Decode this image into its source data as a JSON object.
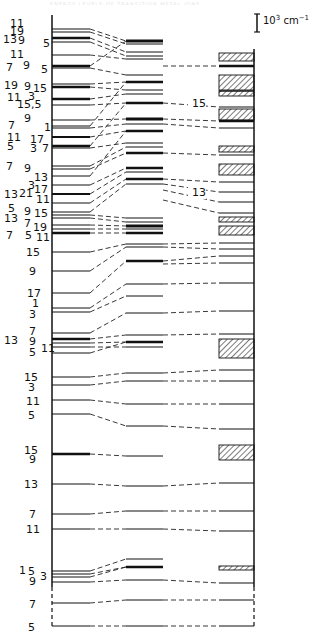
{
  "figure": {
    "header_ghost_text": "ENERGY LEVELS OF TRANSITION METAL IONS",
    "scale_bar": {
      "label": "10",
      "exponent": "3",
      "unit": " cm",
      "unit_exponent": "−1",
      "x": 257,
      "y1": 14,
      "y2": 32
    },
    "connector_labels": [
      {
        "text": "15",
        "x": 192,
        "y": 107
      },
      {
        "text": "13",
        "x": 192,
        "y": 196
      }
    ],
    "columns": {
      "left": {
        "x1": 52,
        "x2": 90
      },
      "middle": {
        "x1": 126,
        "x2": 163
      },
      "right": {
        "x1": 219,
        "x2": 254
      }
    },
    "axis": {
      "x": 52,
      "y_top": 15,
      "y_solid_end": 587,
      "y_bottom": 627,
      "right_x": 254,
      "right_y_top": 49,
      "right_y_solid_end": 587
    },
    "left_levels": [
      {
        "y": 29,
        "w": 1
      },
      {
        "y": 32,
        "w": 1
      },
      {
        "y": 38,
        "w": 2.5
      },
      {
        "y": 42,
        "w": 1
      },
      {
        "y": 55,
        "w": 1
      },
      {
        "y": 66,
        "w": 2.5
      },
      {
        "y": 68,
        "w": 1
      },
      {
        "y": 84,
        "w": 1
      },
      {
        "y": 87,
        "w": 2.5
      },
      {
        "y": 99,
        "w": 2.5
      },
      {
        "y": 105,
        "w": 1
      },
      {
        "y": 120,
        "w": 1
      },
      {
        "y": 126,
        "w": 1
      },
      {
        "y": 128,
        "w": 1
      },
      {
        "y": 137,
        "w": 2
      },
      {
        "y": 146,
        "w": 2.5
      },
      {
        "y": 148,
        "w": 1
      },
      {
        "y": 166,
        "w": 1
      },
      {
        "y": 169,
        "w": 1
      },
      {
        "y": 176,
        "w": 1
      },
      {
        "y": 185,
        "w": 1
      },
      {
        "y": 194,
        "w": 2
      },
      {
        "y": 203,
        "w": 1
      },
      {
        "y": 212,
        "w": 1
      },
      {
        "y": 215,
        "w": 1
      },
      {
        "y": 218,
        "w": 1
      },
      {
        "y": 225,
        "w": 1
      },
      {
        "y": 229,
        "w": 1
      },
      {
        "y": 233,
        "w": 2.5
      },
      {
        "y": 252,
        "w": 1
      },
      {
        "y": 271,
        "w": 1
      },
      {
        "y": 293,
        "w": 1
      },
      {
        "y": 308,
        "w": 1
      },
      {
        "y": 312,
        "w": 1
      },
      {
        "y": 333,
        "w": 1
      },
      {
        "y": 339,
        "w": 2.5
      },
      {
        "y": 343,
        "w": 1
      },
      {
        "y": 347,
        "w": 1
      },
      {
        "y": 353,
        "w": 1
      },
      {
        "y": 377,
        "w": 1
      },
      {
        "y": 385,
        "w": 1
      },
      {
        "y": 400,
        "w": 1
      },
      {
        "y": 414,
        "w": 1
      },
      {
        "y": 454,
        "w": 2.5
      },
      {
        "y": 484,
        "w": 1
      },
      {
        "y": 514,
        "w": 1
      },
      {
        "y": 529,
        "w": 1
      },
      {
        "y": 571,
        "w": 1
      },
      {
        "y": 574,
        "w": 1
      },
      {
        "y": 577,
        "w": 1
      },
      {
        "y": 582,
        "w": 1
      },
      {
        "y": 603,
        "w": 1
      },
      {
        "y": 626,
        "w": 1
      }
    ],
    "middle_levels": [
      {
        "y": 41,
        "w": 3
      },
      {
        "y": 44,
        "w": 1
      },
      {
        "y": 52,
        "w": 1
      },
      {
        "y": 56,
        "w": 1
      },
      {
        "y": 59,
        "w": 1
      },
      {
        "y": 75,
        "w": 1
      },
      {
        "y": 82,
        "w": 2.5
      },
      {
        "y": 90,
        "w": 1
      },
      {
        "y": 94,
        "w": 1
      },
      {
        "y": 103,
        "w": 2.5
      },
      {
        "y": 119,
        "w": 3
      },
      {
        "y": 124,
        "w": 1
      },
      {
        "y": 131,
        "w": 2.5
      },
      {
        "y": 143,
        "w": 1
      },
      {
        "y": 147,
        "w": 1
      },
      {
        "y": 153,
        "w": 2.5
      },
      {
        "y": 168,
        "w": 2.5
      },
      {
        "y": 172,
        "w": 1
      },
      {
        "y": 179,
        "w": 2.5
      },
      {
        "y": 184,
        "w": 1
      },
      {
        "y": 218,
        "w": 1
      },
      {
        "y": 222,
        "w": 1
      },
      {
        "y": 226,
        "w": 3
      },
      {
        "y": 229,
        "w": 1
      },
      {
        "y": 233,
        "w": 2.5
      },
      {
        "y": 244,
        "w": 1
      },
      {
        "y": 247,
        "w": 1
      },
      {
        "y": 261,
        "w": 2.5
      },
      {
        "y": 284,
        "w": 1
      },
      {
        "y": 296,
        "w": 1
      },
      {
        "y": 313,
        "w": 1
      },
      {
        "y": 335,
        "w": 1
      },
      {
        "y": 342,
        "w": 2.5
      },
      {
        "y": 347,
        "w": 1
      },
      {
        "y": 373,
        "w": 1
      },
      {
        "y": 381,
        "w": 1
      },
      {
        "y": 404,
        "w": 1
      },
      {
        "y": 426,
        "w": 1
      },
      {
        "y": 456,
        "w": 1
      },
      {
        "y": 486,
        "w": 1
      },
      {
        "y": 511,
        "w": 1
      },
      {
        "y": 529,
        "w": 1
      },
      {
        "y": 559,
        "w": 1
      },
      {
        "y": 567,
        "w": 2.5
      },
      {
        "y": 580,
        "w": 1
      },
      {
        "y": 600,
        "w": 1
      },
      {
        "y": 626,
        "w": 1
      }
    ],
    "right_levels": [
      {
        "y": 66,
        "w": 2.5
      },
      {
        "y": 91,
        "w": 1
      },
      {
        "y": 107,
        "w": 1
      },
      {
        "y": 121,
        "w": 2.5
      },
      {
        "y": 128,
        "w": 1
      },
      {
        "y": 155,
        "w": 1
      },
      {
        "y": 182,
        "w": 1
      },
      {
        "y": 192,
        "w": 1
      },
      {
        "y": 202,
        "w": 1
      },
      {
        "y": 213,
        "w": 1
      },
      {
        "y": 243,
        "w": 1
      },
      {
        "y": 249,
        "w": 1
      },
      {
        "y": 256,
        "w": 1
      },
      {
        "y": 263,
        "w": 1
      },
      {
        "y": 283,
        "w": 1
      },
      {
        "y": 311,
        "w": 1
      },
      {
        "y": 334,
        "w": 1
      },
      {
        "y": 370,
        "w": 1
      },
      {
        "y": 381,
        "w": 1
      },
      {
        "y": 404,
        "w": 1
      },
      {
        "y": 429,
        "w": 1
      },
      {
        "y": 483,
        "w": 1
      },
      {
        "y": 511,
        "w": 1
      },
      {
        "y": 531,
        "w": 1
      },
      {
        "y": 583,
        "w": 1
      },
      {
        "y": 600,
        "w": 1
      },
      {
        "y": 626,
        "w": 1
      }
    ],
    "hatched_bands": [
      {
        "y": 53,
        "h": 8
      },
      {
        "y": 75,
        "h": 15
      },
      {
        "y": 91,
        "h": 5
      },
      {
        "y": 109,
        "h": 11
      },
      {
        "y": 146,
        "h": 6
      },
      {
        "y": 164,
        "h": 11
      },
      {
        "y": 217,
        "h": 5
      },
      {
        "y": 226,
        "h": 9
      },
      {
        "y": 339,
        "h": 19
      },
      {
        "y": 445,
        "h": 15
      },
      {
        "y": 566,
        "h": 4
      }
    ],
    "connectors": [
      [
        90,
        29,
        126,
        41
      ],
      [
        90,
        32,
        126,
        44
      ],
      [
        90,
        38,
        126,
        52
      ],
      [
        90,
        42,
        126,
        56
      ],
      [
        90,
        55,
        126,
        59
      ],
      [
        90,
        66,
        126,
        41
      ],
      [
        90,
        68,
        126,
        75
      ],
      [
        90,
        84,
        126,
        82
      ],
      [
        90,
        87,
        126,
        90
      ],
      [
        90,
        99,
        126,
        94
      ],
      [
        90,
        105,
        126,
        103
      ],
      [
        90,
        120,
        126,
        119
      ],
      [
        90,
        126,
        126,
        82
      ],
      [
        90,
        128,
        126,
        124
      ],
      [
        90,
        137,
        126,
        131
      ],
      [
        90,
        146,
        126,
        103
      ],
      [
        90,
        148,
        126,
        143
      ],
      [
        90,
        166,
        126,
        147
      ],
      [
        90,
        169,
        126,
        153
      ],
      [
        90,
        176,
        126,
        131
      ],
      [
        90,
        185,
        126,
        168
      ],
      [
        90,
        194,
        126,
        172
      ],
      [
        90,
        203,
        126,
        179
      ],
      [
        90,
        212,
        126,
        184
      ],
      [
        90,
        215,
        126,
        218
      ],
      [
        90,
        218,
        126,
        222
      ],
      [
        90,
        225,
        126,
        226
      ],
      [
        90,
        229,
        126,
        229
      ],
      [
        90,
        233,
        126,
        233
      ],
      [
        90,
        252,
        126,
        244
      ],
      [
        90,
        271,
        126,
        247
      ],
      [
        90,
        293,
        126,
        261
      ],
      [
        90,
        308,
        126,
        284
      ],
      [
        90,
        312,
        126,
        296
      ],
      [
        90,
        333,
        126,
        313
      ],
      [
        90,
        339,
        126,
        335
      ],
      [
        90,
        343,
        126,
        342
      ],
      [
        90,
        347,
        126,
        347
      ],
      [
        90,
        353,
        126,
        342
      ],
      [
        90,
        377,
        126,
        373
      ],
      [
        90,
        385,
        126,
        381
      ],
      [
        90,
        400,
        126,
        404
      ],
      [
        90,
        414,
        126,
        426
      ],
      [
        90,
        454,
        126,
        456
      ],
      [
        90,
        484,
        126,
        486
      ],
      [
        90,
        514,
        126,
        511
      ],
      [
        90,
        529,
        126,
        529
      ],
      [
        90,
        571,
        126,
        559
      ],
      [
        90,
        574,
        126,
        567
      ],
      [
        90,
        577,
        126,
        567
      ],
      [
        90,
        582,
        126,
        580
      ],
      [
        90,
        603,
        126,
        600
      ],
      [
        90,
        626,
        126,
        626
      ],
      [
        163,
        66,
        219,
        66
      ],
      [
        163,
        103,
        219,
        107
      ],
      [
        163,
        119,
        219,
        121
      ],
      [
        163,
        124,
        219,
        128
      ],
      [
        163,
        153,
        219,
        155
      ],
      [
        163,
        179,
        219,
        182
      ],
      [
        163,
        184,
        219,
        192
      ],
      [
        163,
        190,
        219,
        202
      ],
      [
        163,
        200,
        219,
        213
      ],
      [
        163,
        244,
        219,
        243
      ],
      [
        163,
        247,
        219,
        249
      ],
      [
        163,
        261,
        219,
        256
      ],
      [
        163,
        264,
        219,
        263
      ],
      [
        163,
        284,
        219,
        283
      ],
      [
        163,
        313,
        219,
        311
      ],
      [
        163,
        335,
        219,
        334
      ],
      [
        163,
        373,
        219,
        370
      ],
      [
        163,
        381,
        219,
        381
      ],
      [
        163,
        404,
        219,
        404
      ],
      [
        163,
        426,
        219,
        429
      ],
      [
        163,
        486,
        219,
        483
      ],
      [
        163,
        511,
        219,
        511
      ],
      [
        163,
        529,
        219,
        531
      ],
      [
        163,
        580,
        219,
        583
      ],
      [
        163,
        600,
        219,
        600
      ],
      [
        163,
        626,
        219,
        626
      ]
    ],
    "left_labels": [
      {
        "text": "11",
        "x": 10,
        "y": 27
      },
      {
        "text": "19",
        "x": 10,
        "y": 35
      },
      {
        "text": "13",
        "x": 3,
        "y": 43
      },
      {
        "text": "9",
        "x": 18,
        "y": 44
      },
      {
        "text": "5",
        "x": 43,
        "y": 47
      },
      {
        "text": "11",
        "x": 10,
        "y": 58
      },
      {
        "text": "7",
        "x": 6,
        "y": 71
      },
      {
        "text": "9",
        "x": 23,
        "y": 69
      },
      {
        "text": "5",
        "x": 41,
        "y": 73
      },
      {
        "text": "19",
        "x": 4,
        "y": 89
      },
      {
        "text": "9",
        "x": 24,
        "y": 90
      },
      {
        "text": "15",
        "x": 33,
        "y": 92
      },
      {
        "text": "11",
        "x": 7,
        "y": 101
      },
      {
        "text": "3",
        "x": 28,
        "y": 100
      },
      {
        "text": "15,5",
        "x": 17,
        "y": 108
      },
      {
        "text": "9",
        "x": 24,
        "y": 122
      },
      {
        "text": "7",
        "x": 8,
        "y": 129
      },
      {
        "text": "1",
        "x": 44,
        "y": 131
      },
      {
        "text": "11",
        "x": 7,
        "y": 141
      },
      {
        "text": "17",
        "x": 30,
        "y": 143
      },
      {
        "text": "5",
        "x": 7,
        "y": 150
      },
      {
        "text": "3",
        "x": 30,
        "y": 152
      },
      {
        "text": "7",
        "x": 42,
        "y": 152
      },
      {
        "text": "7",
        "x": 6,
        "y": 170
      },
      {
        "text": "9",
        "x": 24,
        "y": 172
      },
      {
        "text": "13",
        "x": 34,
        "y": 181
      },
      {
        "text": "3",
        "x": 28,
        "y": 189
      },
      {
        "text": "17",
        "x": 34,
        "y": 193
      },
      {
        "text": "13",
        "x": 4,
        "y": 198
      },
      {
        "text": "21",
        "x": 19,
        "y": 197
      },
      {
        "text": "11",
        "x": 36,
        "y": 203
      },
      {
        "text": "5",
        "x": 8,
        "y": 212
      },
      {
        "text": "9",
        "x": 24,
        "y": 215
      },
      {
        "text": "15",
        "x": 34,
        "y": 217
      },
      {
        "text": "13",
        "x": 4,
        "y": 222
      },
      {
        "text": "7",
        "x": 24,
        "y": 227
      },
      {
        "text": "19",
        "x": 33,
        "y": 231
      },
      {
        "text": "7",
        "x": 6,
        "y": 239
      },
      {
        "text": "5",
        "x": 25,
        "y": 239
      },
      {
        "text": "11",
        "x": 36,
        "y": 241
      },
      {
        "text": "15",
        "x": 26,
        "y": 256
      },
      {
        "text": "9",
        "x": 29,
        "y": 275
      },
      {
        "text": "17",
        "x": 27,
        "y": 297
      },
      {
        "text": "1",
        "x": 32,
        "y": 307
      },
      {
        "text": "3",
        "x": 29,
        "y": 318
      },
      {
        "text": "7",
        "x": 29,
        "y": 335
      },
      {
        "text": "13",
        "x": 4,
        "y": 344
      },
      {
        "text": "9",
        "x": 29,
        "y": 345
      },
      {
        "text": "11",
        "x": 41,
        "y": 352
      },
      {
        "text": "5",
        "x": 29,
        "y": 356
      },
      {
        "text": "15",
        "x": 24,
        "y": 381
      },
      {
        "text": "3",
        "x": 28,
        "y": 391
      },
      {
        "text": "11",
        "x": 26,
        "y": 405
      },
      {
        "text": "5",
        "x": 28,
        "y": 419
      },
      {
        "text": "15",
        "x": 24,
        "y": 454
      },
      {
        "text": "9",
        "x": 29,
        "y": 463
      },
      {
        "text": "13",
        "x": 24,
        "y": 488
      },
      {
        "text": "7",
        "x": 29,
        "y": 518
      },
      {
        "text": "11",
        "x": 26,
        "y": 533
      },
      {
        "text": "1",
        "x": 19,
        "y": 574
      },
      {
        "text": "5",
        "x": 28,
        "y": 575
      },
      {
        "text": "3",
        "x": 40,
        "y": 580
      },
      {
        "text": "9",
        "x": 29,
        "y": 585
      },
      {
        "text": "7",
        "x": 29,
        "y": 608
      },
      {
        "text": "5",
        "x": 28,
        "y": 631
      }
    ]
  }
}
